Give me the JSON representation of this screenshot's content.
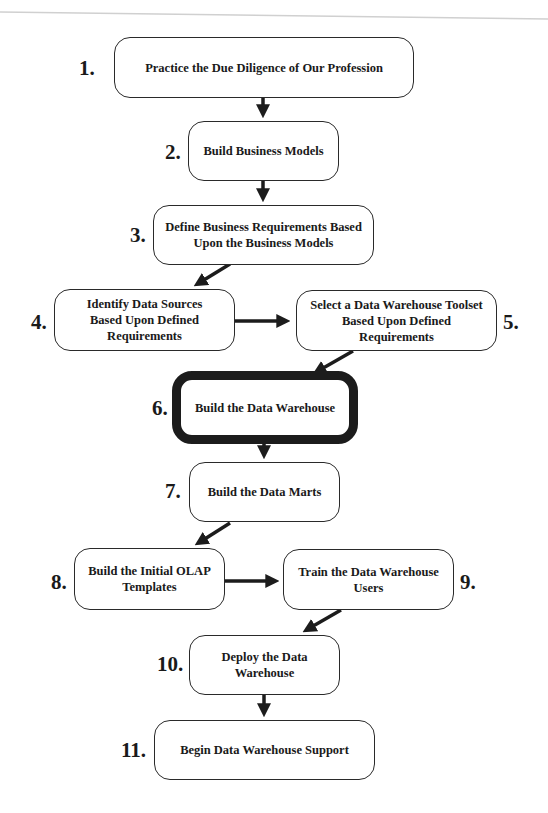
{
  "diagram": {
    "type": "flowchart",
    "steps": [
      {
        "number": "1.",
        "label": "Practice the Due Diligence of Our Profession"
      },
      {
        "number": "2.",
        "label": "Build Business Models"
      },
      {
        "number": "3.",
        "label": "Define Business Requirements Based\nUpon the Business Models"
      },
      {
        "number": "4.",
        "label": "Identify Data Sources\nBased Upon Defined\nRequirements"
      },
      {
        "number": "5.",
        "label": "Select a Data Warehouse Toolset\nBased Upon Defined\nRequirements"
      },
      {
        "number": "6.",
        "label": "Build the Data Warehouse",
        "highlighted": true
      },
      {
        "number": "7.",
        "label": "Build the Data Marts"
      },
      {
        "number": "8.",
        "label": "Build the Initial OLAP\nTemplates"
      },
      {
        "number": "9.",
        "label": "Train the Data Warehouse\nUsers"
      },
      {
        "number": "10.",
        "label": "Deploy the Data\nWarehouse"
      },
      {
        "number": "11.",
        "label": "Begin Data Warehouse Support"
      }
    ],
    "edges": [
      {
        "from": 1,
        "to": 2
      },
      {
        "from": 2,
        "to": 3
      },
      {
        "from": 3,
        "to": 4
      },
      {
        "from": 4,
        "to": 5
      },
      {
        "from": 5,
        "to": 6
      },
      {
        "from": 6,
        "to": 7
      },
      {
        "from": 7,
        "to": 8
      },
      {
        "from": 8,
        "to": 9
      },
      {
        "from": 9,
        "to": 10
      },
      {
        "from": 10,
        "to": 11
      }
    ],
    "colors": {
      "stroke": "#1c1c1c",
      "background": "#ffffff",
      "text": "#1a1a1a"
    }
  }
}
